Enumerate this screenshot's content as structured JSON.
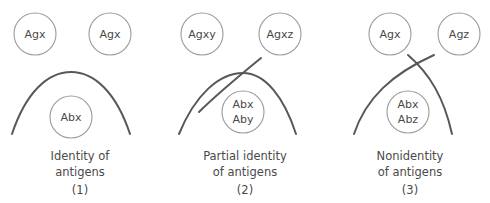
{
  "figure": {
    "line_color": "#585858",
    "well_color": "#9a9a9a",
    "text_color": "#4a4a4a",
    "background": "#ffffff"
  },
  "panels": [
    {
      "id": "1",
      "number": "(1)",
      "caption_line1": "Identity of",
      "caption_line2": "antigens",
      "antigen_wells": [
        {
          "label": "Agx"
        },
        {
          "label": "Agx"
        }
      ],
      "antibody_well": {
        "label_line1": "Abx",
        "label_line2": ""
      },
      "precipitin": {
        "type": "single-continuous-arc",
        "spur": false
      }
    },
    {
      "id": "2",
      "number": "(2)",
      "caption_line1": "Partial identity",
      "caption_line2": "of antigens",
      "antigen_wells": [
        {
          "label": "Agxy"
        },
        {
          "label": "Agxz"
        }
      ],
      "antibody_well": {
        "label_line1": "Abx",
        "label_line2": "Aby"
      },
      "precipitin": {
        "type": "fused-arc-with-spur",
        "spur": true
      }
    },
    {
      "id": "3",
      "number": "(3)",
      "caption_line1": "Nonidentity",
      "caption_line2": "of antigens",
      "antigen_wells": [
        {
          "label": "Agx"
        },
        {
          "label": "Agz"
        }
      ],
      "antibody_well": {
        "label_line1": "Abx",
        "label_line2": "Abz"
      },
      "precipitin": {
        "type": "crossed-arcs",
        "spur": false
      }
    }
  ]
}
